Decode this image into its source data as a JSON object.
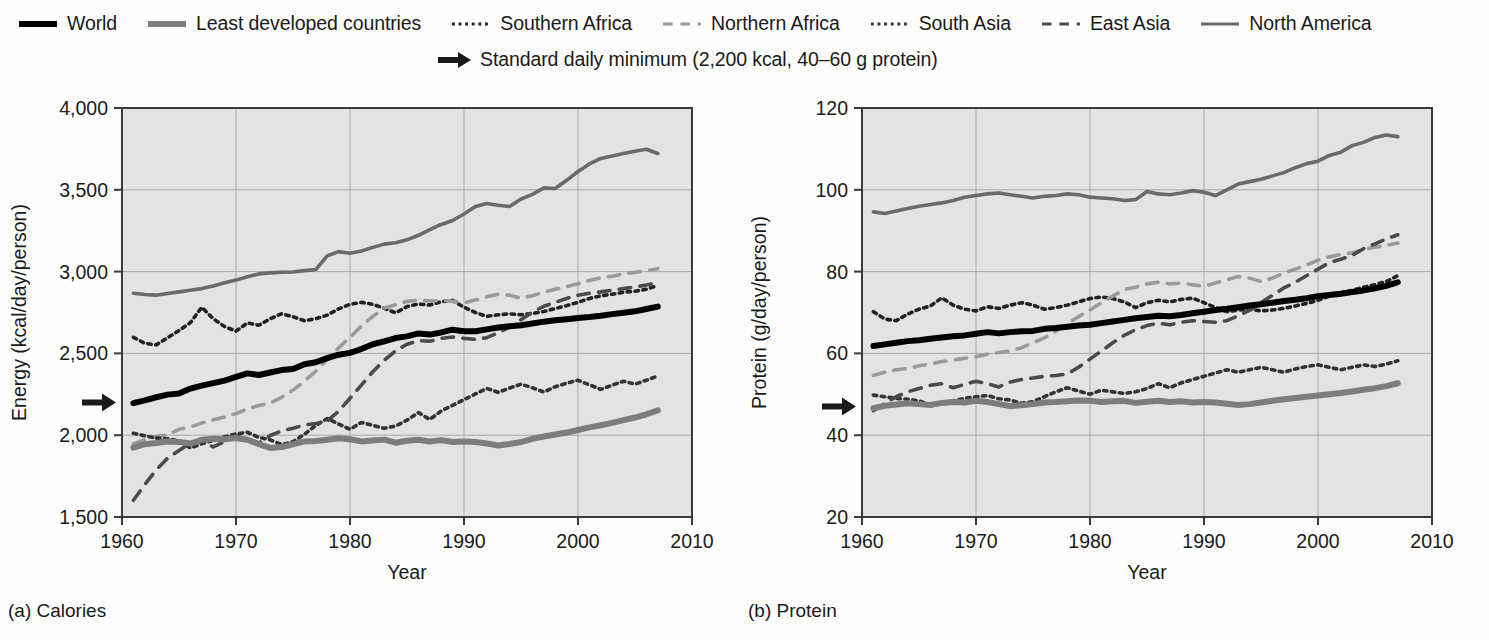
{
  "legend": {
    "row1": [
      {
        "label": "World",
        "style": "solid",
        "width": 6,
        "color": "#000000",
        "name": "legend-world"
      },
      {
        "label": "Least developed countries",
        "style": "solid",
        "width": 6,
        "color": "#7d7d7d",
        "name": "legend-least-developed-countries"
      },
      {
        "label": "Southern Africa",
        "style": "dotted",
        "width": 3,
        "color": "#222222",
        "name": "legend-southern-africa"
      },
      {
        "label": "Northern Africa",
        "style": "dashed",
        "width": 3,
        "color": "#9a9a9a",
        "name": "legend-northern-africa"
      },
      {
        "label": "South Asia",
        "style": "dotted",
        "width": 3,
        "color": "#333333",
        "name": "legend-south-asia"
      },
      {
        "label": "East Asia",
        "style": "dashed",
        "width": 3,
        "color": "#4a4a4a",
        "name": "legend-east-asia"
      },
      {
        "label": "North America",
        "style": "solid",
        "width": 3,
        "color": "#6a6a6a",
        "name": "legend-north-america"
      }
    ],
    "row2": {
      "label": "Standard daily minimum (2,200 kcal, 40–60 g protein)",
      "icon": "right-arrow-icon"
    }
  },
  "captions": {
    "a": "(a) Calories",
    "b": "(b) Protein"
  },
  "chart_data": [
    {
      "id": "calories",
      "type": "line",
      "title": "(a) Calories",
      "xlabel": "Year",
      "ylabel": "Energy (kcal/day/person)",
      "xlim": [
        1960,
        2010
      ],
      "ylim": [
        1500,
        4000
      ],
      "xticks": [
        1960,
        1970,
        1980,
        1990,
        2000,
        2010
      ],
      "yticks": [
        1500,
        2000,
        2500,
        3000,
        3500,
        4000
      ],
      "ytick_labels": [
        "1,500",
        "2,000",
        "2,500",
        "3,000",
        "3,500",
        "4,000"
      ],
      "grid": true,
      "legend_position": "above-figure",
      "reference_marker": {
        "label": "Standard daily minimum",
        "value": 2200,
        "icon": "right-arrow-icon"
      },
      "x": [
        1961,
        1962,
        1963,
        1964,
        1965,
        1966,
        1967,
        1968,
        1969,
        1970,
        1971,
        1972,
        1973,
        1974,
        1975,
        1976,
        1977,
        1978,
        1979,
        1980,
        1981,
        1982,
        1983,
        1984,
        1985,
        1986,
        1987,
        1988,
        1989,
        1990,
        1991,
        1992,
        1993,
        1994,
        1995,
        1996,
        1997,
        1998,
        1999,
        2000,
        2001,
        2002,
        2003,
        2004,
        2005,
        2006,
        2007
      ],
      "series": [
        {
          "name": "World",
          "style": "solid",
          "width": 6,
          "color": "#000000",
          "values": [
            2196,
            2213,
            2232,
            2248,
            2255,
            2285,
            2303,
            2318,
            2334,
            2356,
            2378,
            2368,
            2383,
            2398,
            2404,
            2434,
            2446,
            2471,
            2492,
            2503,
            2527,
            2556,
            2574,
            2594,
            2604,
            2622,
            2615,
            2628,
            2645,
            2636,
            2635,
            2647,
            2658,
            2666,
            2672,
            2683,
            2694,
            2702,
            2709,
            2716,
            2722,
            2730,
            2740,
            2748,
            2757,
            2771,
            2786
          ]
        },
        {
          "name": "Least developed countries",
          "style": "solid",
          "width": 6,
          "color": "#7d7d7d",
          "values": [
            1924,
            1945,
            1952,
            1962,
            1958,
            1949,
            1972,
            1978,
            1975,
            1982,
            1972,
            1945,
            1922,
            1928,
            1944,
            1962,
            1964,
            1972,
            1981,
            1975,
            1962,
            1968,
            1973,
            1954,
            1966,
            1972,
            1962,
            1970,
            1958,
            1962,
            1958,
            1949,
            1937,
            1946,
            1958,
            1978,
            1992,
            2004,
            2016,
            2032,
            2048,
            2061,
            2075,
            2092,
            2108,
            2128,
            2152
          ]
        },
        {
          "name": "Southern Africa",
          "style": "dotted",
          "width": 3.6,
          "color": "#222222",
          "values": [
            2598,
            2562,
            2552,
            2596,
            2640,
            2688,
            2782,
            2712,
            2664,
            2636,
            2686,
            2672,
            2712,
            2742,
            2724,
            2700,
            2712,
            2734,
            2772,
            2800,
            2812,
            2800,
            2776,
            2748,
            2786,
            2802,
            2796,
            2816,
            2824,
            2782,
            2750,
            2726,
            2736,
            2742,
            2736,
            2744,
            2756,
            2774,
            2792,
            2812,
            2836,
            2852,
            2862,
            2874,
            2880,
            2892,
            2916
          ]
        },
        {
          "name": "Northern Africa",
          "style": "dashed",
          "width": 3.6,
          "color": "#9a9a9a",
          "values": [
            1946,
            1972,
            1992,
            2002,
            2036,
            2050,
            2074,
            2094,
            2110,
            2132,
            2160,
            2182,
            2196,
            2232,
            2276,
            2330,
            2392,
            2462,
            2534,
            2598,
            2668,
            2726,
            2778,
            2796,
            2818,
            2826,
            2820,
            2824,
            2818,
            2810,
            2826,
            2846,
            2862,
            2856,
            2838,
            2852,
            2874,
            2892,
            2908,
            2926,
            2946,
            2962,
            2972,
            2986,
            2996,
            3004,
            3018
          ]
        },
        {
          "name": "South Asia",
          "style": "dotted",
          "width": 3.6,
          "color": "#333333",
          "values": [
            2012,
            1996,
            1982,
            1978,
            1966,
            1922,
            1948,
            1968,
            1990,
            2008,
            2018,
            1986,
            1972,
            1942,
            1960,
            2006,
            2060,
            2102,
            2068,
            2036,
            2078,
            2060,
            2042,
            2056,
            2092,
            2138,
            2096,
            2148,
            2182,
            2218,
            2252,
            2286,
            2262,
            2288,
            2312,
            2290,
            2264,
            2296,
            2318,
            2336,
            2308,
            2280,
            2306,
            2330,
            2312,
            2336,
            2362
          ]
        },
        {
          "name": "East Asia",
          "style": "dashed",
          "width": 3.6,
          "color": "#4a4a4a",
          "values": [
            1602,
            1698,
            1788,
            1860,
            1906,
            1952,
            1966,
            1928,
            1962,
            1996,
            1978,
            1952,
            1998,
            2026,
            2042,
            2062,
            2072,
            2086,
            2146,
            2226,
            2306,
            2388,
            2458,
            2516,
            2556,
            2578,
            2574,
            2592,
            2600,
            2592,
            2586,
            2596,
            2626,
            2660,
            2706,
            2752,
            2788,
            2812,
            2836,
            2856,
            2868,
            2876,
            2886,
            2896,
            2906,
            2918,
            2932
          ]
        },
        {
          "name": "North America",
          "style": "solid",
          "width": 3.6,
          "color": "#6a6a6a",
          "values": [
            2868,
            2860,
            2856,
            2866,
            2876,
            2886,
            2896,
            2912,
            2932,
            2948,
            2968,
            2986,
            2992,
            2996,
            2998,
            3006,
            3012,
            3096,
            3122,
            3112,
            3126,
            3148,
            3168,
            3176,
            3194,
            3222,
            3256,
            3288,
            3312,
            3352,
            3398,
            3416,
            3406,
            3398,
            3444,
            3472,
            3512,
            3508,
            3558,
            3612,
            3658,
            3692,
            3706,
            3722,
            3736,
            3748,
            3722
          ]
        }
      ]
    },
    {
      "id": "protein",
      "type": "line",
      "title": "(b) Protein",
      "xlabel": "Year",
      "ylabel": "Protein (g/day/person)",
      "xlim": [
        1960,
        2010
      ],
      "ylim": [
        20,
        120
      ],
      "xticks": [
        1960,
        1970,
        1980,
        1990,
        2000,
        2010
      ],
      "yticks": [
        20,
        40,
        60,
        80,
        100,
        120
      ],
      "ytick_labels": [
        "20",
        "40",
        "60",
        "80",
        "100",
        "120"
      ],
      "grid": true,
      "legend_position": "above-figure",
      "reference_marker": {
        "label": "Standard daily minimum",
        "value": 47,
        "icon": "right-arrow-icon"
      },
      "x": [
        1961,
        1962,
        1963,
        1964,
        1965,
        1966,
        1967,
        1968,
        1969,
        1970,
        1971,
        1972,
        1973,
        1974,
        1975,
        1976,
        1977,
        1978,
        1979,
        1980,
        1981,
        1982,
        1983,
        1984,
        1985,
        1986,
        1987,
        1988,
        1989,
        1990,
        1991,
        1992,
        1993,
        1994,
        1995,
        1996,
        1997,
        1998,
        1999,
        2000,
        2001,
        2002,
        2003,
        2004,
        2005,
        2006,
        2007
      ],
      "series": [
        {
          "name": "World",
          "style": "solid",
          "width": 6,
          "color": "#000000",
          "values": [
            61.8,
            62.2,
            62.6,
            63.0,
            63.2,
            63.6,
            63.9,
            64.2,
            64.4,
            64.8,
            65.2,
            64.9,
            65.2,
            65.4,
            65.5,
            66.0,
            66.2,
            66.5,
            66.8,
            67.0,
            67.4,
            67.8,
            68.2,
            68.6,
            68.9,
            69.2,
            69.1,
            69.4,
            69.8,
            70.2,
            70.6,
            70.9,
            71.3,
            71.7,
            72.0,
            72.4,
            72.8,
            73.1,
            73.5,
            74.0,
            74.3,
            74.6,
            75.0,
            75.4,
            75.9,
            76.5,
            77.4
          ]
        },
        {
          "name": "Least developed countries",
          "style": "solid",
          "width": 6,
          "color": "#7d7d7d",
          "values": [
            46.6,
            47.2,
            47.5,
            47.8,
            47.6,
            47.4,
            47.9,
            48.1,
            48.0,
            48.4,
            48.1,
            47.6,
            47.1,
            47.3,
            47.6,
            48.0,
            48.1,
            48.3,
            48.5,
            48.4,
            48.1,
            48.3,
            48.4,
            47.9,
            48.2,
            48.4,
            48.1,
            48.3,
            48.0,
            48.1,
            48.0,
            47.7,
            47.4,
            47.6,
            48.0,
            48.4,
            48.8,
            49.1,
            49.4,
            49.7,
            50.0,
            50.3,
            50.7,
            51.1,
            51.5,
            52.0,
            52.7
          ]
        },
        {
          "name": "Southern Africa",
          "style": "dotted",
          "width": 3.6,
          "color": "#222222",
          "values": [
            70.2,
            68.4,
            68.0,
            69.6,
            70.8,
            71.6,
            73.6,
            71.8,
            70.8,
            70.4,
            71.4,
            71.0,
            71.8,
            72.4,
            71.8,
            70.8,
            71.2,
            71.8,
            72.6,
            73.4,
            73.8,
            73.4,
            72.6,
            71.2,
            72.4,
            73.0,
            72.6,
            73.2,
            73.5,
            72.4,
            71.2,
            70.2,
            70.6,
            70.8,
            70.4,
            70.6,
            71.0,
            71.6,
            72.2,
            73.0,
            74.0,
            74.8,
            75.4,
            76.2,
            76.8,
            77.6,
            79.0
          ]
        },
        {
          "name": "Northern Africa",
          "style": "dashed",
          "width": 3.6,
          "color": "#9a9a9a",
          "values": [
            54.6,
            55.4,
            56.0,
            56.3,
            57.0,
            57.4,
            58.0,
            58.4,
            58.8,
            59.2,
            59.8,
            60.2,
            60.6,
            61.4,
            62.6,
            63.8,
            65.4,
            67.2,
            69.0,
            70.6,
            72.4,
            74.0,
            75.6,
            76.2,
            77.0,
            77.4,
            77.0,
            77.2,
            76.8,
            76.4,
            77.2,
            78.0,
            78.8,
            78.4,
            77.6,
            78.4,
            79.6,
            80.6,
            81.6,
            82.8,
            83.6,
            84.2,
            84.6,
            85.4,
            86.0,
            86.4,
            87.0
          ]
        },
        {
          "name": "South Asia",
          "style": "dotted",
          "width": 3.6,
          "color": "#333333",
          "values": [
            49.8,
            49.4,
            49.0,
            48.8,
            48.4,
            47.4,
            48.0,
            48.4,
            49.0,
            49.4,
            49.7,
            48.9,
            48.6,
            47.8,
            48.2,
            49.4,
            50.6,
            51.6,
            50.8,
            50.0,
            51.0,
            50.6,
            50.2,
            50.6,
            51.4,
            52.6,
            51.6,
            52.8,
            53.6,
            54.4,
            55.2,
            56.0,
            55.4,
            56.0,
            56.6,
            56.0,
            55.4,
            56.2,
            56.8,
            57.2,
            56.6,
            56.0,
            56.6,
            57.2,
            56.8,
            57.4,
            58.2
          ]
        },
        {
          "name": "East Asia",
          "style": "dashed",
          "width": 3.6,
          "color": "#4a4a4a",
          "values": [
            46.0,
            47.8,
            49.4,
            50.6,
            51.4,
            52.2,
            52.6,
            51.6,
            52.4,
            53.2,
            52.6,
            51.8,
            53.0,
            53.6,
            54.0,
            54.4,
            54.6,
            55.0,
            56.6,
            58.6,
            60.6,
            62.6,
            64.4,
            65.8,
            66.8,
            67.4,
            67.0,
            67.6,
            68.0,
            67.8,
            67.6,
            68.0,
            69.2,
            70.6,
            72.4,
            74.2,
            76.0,
            77.4,
            79.0,
            80.6,
            82.2,
            83.0,
            84.0,
            85.6,
            86.8,
            88.0,
            89.0
          ]
        },
        {
          "name": "North America",
          "style": "solid",
          "width": 3.6,
          "color": "#6a6a6a",
          "values": [
            94.6,
            94.2,
            94.8,
            95.4,
            96.0,
            96.4,
            96.8,
            97.4,
            98.2,
            98.6,
            99.0,
            99.2,
            98.8,
            98.4,
            98.0,
            98.4,
            98.6,
            99.0,
            98.8,
            98.2,
            98.0,
            97.8,
            97.4,
            97.6,
            99.6,
            99.0,
            98.8,
            99.2,
            99.8,
            99.4,
            98.6,
            100.0,
            101.4,
            102.0,
            102.6,
            103.4,
            104.2,
            105.4,
            106.4,
            107.0,
            108.4,
            109.2,
            110.8,
            111.6,
            112.8,
            113.4,
            113.0
          ]
        }
      ]
    }
  ]
}
